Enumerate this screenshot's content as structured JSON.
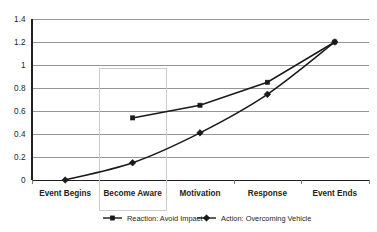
{
  "chart_data": {
    "type": "line",
    "title": "",
    "subtitle": "",
    "xlabel": "",
    "ylabel": "",
    "categories": [
      "Event Begins",
      "Become Aware",
      "Motivation",
      "Response",
      "Event Ends"
    ],
    "ylim": [
      0,
      1.4
    ],
    "ytick_labels": [
      "0",
      "0.2",
      "0.4",
      "0.6",
      "0.8",
      "1",
      "1.2",
      "1.4"
    ],
    "ytick_values": [
      0,
      0.2,
      0.4,
      0.6,
      0.8,
      1.0,
      1.2,
      1.4
    ],
    "grid": true,
    "legend_position": "bottom",
    "series": [
      {
        "name": "Reaction: Avoid Impact",
        "marker": "square",
        "color": "#1a1a1a",
        "interpolation": "linear",
        "values": [
          null,
          0.54,
          0.65,
          0.85,
          1.2
        ]
      },
      {
        "name": "Action: Overcoming Vehicle",
        "marker": "diamond",
        "color": "#1a1a1a",
        "interpolation": "smooth",
        "values": [
          0.0,
          0.15,
          0.41,
          0.745,
          1.2
        ]
      }
    ],
    "annotations": [
      {
        "type": "highlight-box",
        "target_category": "Become Aware",
        "stroke": "#cccccc"
      }
    ]
  },
  "legend": {
    "entries": [
      {
        "label": "Reaction: Avoid Impact",
        "marker": "square"
      },
      {
        "label": "Action: Overcoming Vehicle",
        "marker": "diamond"
      }
    ]
  }
}
